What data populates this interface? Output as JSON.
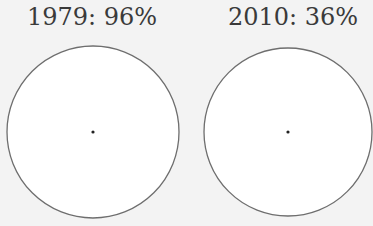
{
  "chart_data": [
    {
      "type": "pie",
      "title": "1979: 96%",
      "year": "1979",
      "value_percent": 96,
      "center": [
        93,
        132
      ],
      "radius": 86,
      "fill": "#ffffff",
      "stroke": "#6e6e6e"
    },
    {
      "type": "pie",
      "title": "2010: 36%",
      "year": "2010",
      "value_percent": 36,
      "center": [
        288,
        132
      ],
      "radius": 84,
      "fill": "#ffffff",
      "stroke": "#6e6e6e"
    }
  ],
  "labels": {
    "left": "1979: 96%",
    "right": "2010: 36%"
  },
  "colors": {
    "background": "#f3f3f3",
    "circle_fill": "#ffffff",
    "circle_stroke": "#6e6e6e",
    "center_dot": "#222222",
    "text": "#3a3a3a"
  }
}
